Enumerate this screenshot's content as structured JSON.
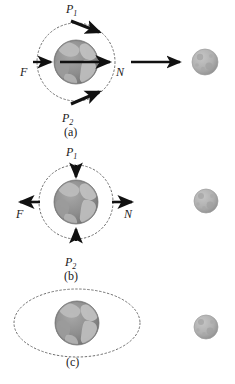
{
  "figure": {
    "background": "#ffffff",
    "width": 235,
    "height": 384,
    "colors": {
      "ocean": "#8d8d8d",
      "land": "#b9b9b9",
      "earth_edge": "#7a7a7a",
      "moon_body": "#b0b0b0",
      "moon_shade": "#9a9a9a",
      "arrow": "#111111",
      "dashed_orbit": "#6e6e6e",
      "text": "#1a1a1a"
    }
  },
  "panels": [
    {
      "id": "a",
      "caption": "(a)",
      "earth": {
        "cx": 76,
        "cy": 62,
        "r": 22,
        "name": "earth-sphere"
      },
      "orbit": {
        "cx": 76,
        "cy": 62,
        "rx": 39,
        "ry": 39,
        "style": "dashed-circle"
      },
      "moon": {
        "cx": 205,
        "cy": 62,
        "r": 13
      },
      "labels": [
        {
          "key": "P1",
          "text": "P",
          "sub": "1",
          "x": 68,
          "y": 7
        },
        {
          "key": "P2",
          "text": "P",
          "sub": "2",
          "x": 64,
          "y": 116
        },
        {
          "key": "F",
          "text": "F",
          "sub": "",
          "x": 22,
          "y": 71
        },
        {
          "key": "N",
          "text": "N",
          "sub": "",
          "x": 118,
          "y": 71
        }
      ],
      "arrows": [
        {
          "name": "arrow-p1-tangential",
          "kind": "thick-diagonal",
          "x1": 72,
          "y1": 22,
          "x2": 103,
          "y2": 35
        },
        {
          "name": "arrow-p2-tangential",
          "kind": "thick-diagonal",
          "x1": 72,
          "y1": 103,
          "x2": 103,
          "y2": 90
        },
        {
          "name": "arrow-force-f",
          "kind": "short-right",
          "x1": 33,
          "y1": 62,
          "x2": 55,
          "y2": 62
        },
        {
          "name": "arrow-center-n",
          "kind": "long-right",
          "x1": 60,
          "y1": 62,
          "x2": 113,
          "y2": 62
        },
        {
          "name": "arrow-toward-moon",
          "kind": "long-right",
          "x1": 132,
          "y1": 62,
          "x2": 182,
          "y2": 62
        }
      ]
    },
    {
      "id": "b",
      "caption": "(b)",
      "earth": {
        "cx": 76,
        "cy": 202,
        "r": 22,
        "name": "earth-sphere"
      },
      "orbit": {
        "cx": 76,
        "cy": 202,
        "rx": 37,
        "ry": 37,
        "style": "dashed-circle"
      },
      "moon": {
        "cx": 206,
        "cy": 201,
        "r": 12
      },
      "labels": [
        {
          "key": "P1",
          "text": "P",
          "sub": "1",
          "x": 68,
          "y": 150
        },
        {
          "key": "P2",
          "text": "P",
          "sub": "2",
          "x": 66,
          "y": 260
        },
        {
          "key": "F",
          "text": "F",
          "sub": "",
          "x": 18,
          "y": 212
        },
        {
          "key": "N",
          "text": "N",
          "sub": "",
          "x": 124,
          "y": 212
        }
      ],
      "arrows": [
        {
          "name": "arrow-p1-inward",
          "kind": "down",
          "x1": 76,
          "y1": 165,
          "x2": 76,
          "y2": 180
        },
        {
          "name": "arrow-p2-inward",
          "kind": "up",
          "x1": 76,
          "y1": 240,
          "x2": 76,
          "y2": 225
        },
        {
          "name": "arrow-force-f-left",
          "kind": "left",
          "x1": 40,
          "y1": 202,
          "x2": 17,
          "y2": 202
        },
        {
          "name": "arrow-force-n-right",
          "kind": "right",
          "x1": 112,
          "y1": 202,
          "x2": 135,
          "y2": 202
        }
      ]
    },
    {
      "id": "c",
      "caption": "(c)",
      "earth": {
        "cx": 77,
        "cy": 323,
        "r": 22,
        "name": "earth-sphere"
      },
      "orbit": {
        "cx": 77,
        "cy": 323,
        "rx": 63,
        "ry": 34,
        "style": "dashed-ellipse"
      },
      "moon": {
        "cx": 206,
        "cy": 327,
        "r": 12
      },
      "labels": [],
      "arrows": []
    }
  ],
  "captions": [
    {
      "id": "caption-a",
      "text": "(a)",
      "x": 66,
      "y": 130
    },
    {
      "id": "caption-b",
      "text": "(b)",
      "x": 66,
      "y": 274
    },
    {
      "id": "caption-c",
      "text": "(c)",
      "x": 69,
      "y": 358
    }
  ]
}
